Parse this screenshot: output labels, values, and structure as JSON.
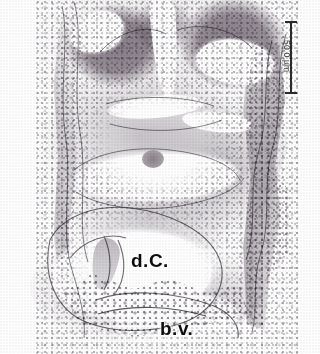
{
  "figure": {
    "type": "histology-micrograph",
    "width_px": 320,
    "height_px": 354,
    "background_color": "#ffffff"
  },
  "scalebar": {
    "name": "scale-bar",
    "label": "50.0 µm",
    "value": 50.0,
    "unit": "µm",
    "orientation": "vertical",
    "color": "#2b2b2b",
    "position": "top-right"
  },
  "annotations": [
    {
      "id": "dc",
      "label": "d.C.",
      "meaning": "dorsal cavity",
      "color": "#0d0d0d",
      "x_px": 131,
      "y_px": 250
    },
    {
      "id": "bv",
      "label": "b.v.",
      "meaning": "blood vessel",
      "color": "#0d0d0d",
      "x_px": 160,
      "y_px": 318
    }
  ],
  "structures": [
    {
      "name": "neural-tissue-left",
      "tone": "#9b929c",
      "region": "upper-left"
    },
    {
      "name": "neural-tissue-right",
      "tone": "#9a919b",
      "region": "upper-right"
    },
    {
      "name": "lumen-left",
      "tone": "#ffffff",
      "region": "upper-left"
    },
    {
      "name": "lumen-right",
      "tone": "#ffffff",
      "region": "upper-right"
    },
    {
      "name": "midline-cleft",
      "tone": "#ffffff",
      "region": "upper-center"
    },
    {
      "name": "mesenchyme",
      "tone": "#a8a2aa",
      "region": "middle"
    },
    {
      "name": "gut-lumen",
      "tone": "#ffffff",
      "region": "middle"
    },
    {
      "name": "dorsal-cavity",
      "tone": "#ffffff",
      "region": "lower"
    },
    {
      "name": "blood-vessel-lumen",
      "tone": "#ffffff",
      "region": "lower"
    },
    {
      "name": "epithelial-band-right",
      "tone": "#8c858e",
      "region": "right-edge"
    },
    {
      "name": "epithelial-band-left",
      "tone": "#98919a",
      "region": "left-edge"
    }
  ],
  "palette": {
    "background": "#ffffff",
    "tissue_dark": "#8e8590",
    "tissue_mid": "#a8a2aa",
    "tissue_light": "#c8c3c9",
    "lumen": "#ffffff",
    "ink": "#2b2b2b",
    "label_text": "#0d0d0d"
  }
}
